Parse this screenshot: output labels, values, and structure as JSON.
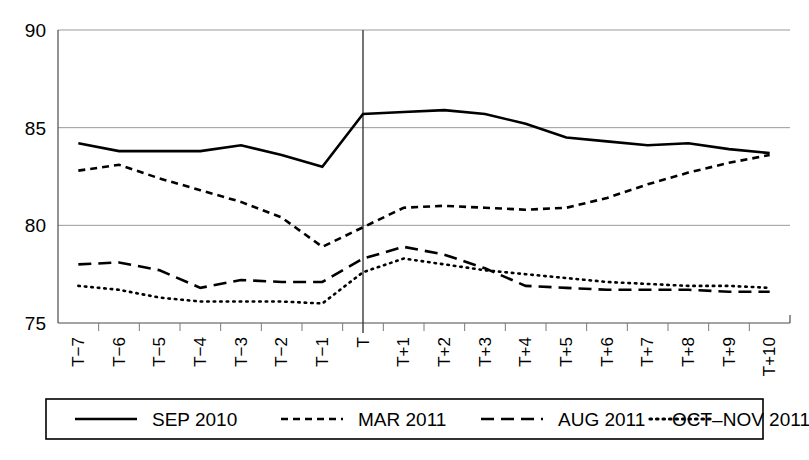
{
  "chart_data": {
    "type": "line",
    "title": "",
    "subtitle": "",
    "xlabel": "",
    "ylabel": "",
    "ylim": [
      75,
      90
    ],
    "yticks": [
      75,
      80,
      85,
      90
    ],
    "ytick_labels": [
      "75",
      "80",
      "85",
      "90"
    ],
    "grid": true,
    "legend_position": "bottom",
    "annotations": [
      {
        "type": "vertical-reference-line",
        "at_category": "T"
      }
    ],
    "categories": [
      "T−7",
      "T−6",
      "T−5",
      "T−4",
      "T−3",
      "T−2",
      "T−1",
      "T",
      "T+1",
      "T+2",
      "T+3",
      "T+4",
      "T+5",
      "T+6",
      "T+7",
      "T+8",
      "T+9",
      "T+10"
    ],
    "series": [
      {
        "name": "SEP 2010",
        "style": "solid",
        "color": "#000000",
        "values": [
          84.2,
          83.8,
          83.8,
          83.8,
          84.1,
          83.6,
          83.0,
          85.7,
          85.8,
          85.9,
          85.7,
          85.2,
          84.5,
          84.3,
          84.1,
          84.2,
          83.9,
          83.7
        ]
      },
      {
        "name": "MAR 2011",
        "style": "short-dash",
        "color": "#000000",
        "values": [
          82.8,
          83.1,
          82.4,
          81.8,
          81.2,
          80.4,
          78.9,
          79.9,
          80.9,
          81.0,
          80.9,
          80.8,
          80.9,
          81.4,
          82.1,
          82.7,
          83.2,
          83.6
        ]
      },
      {
        "name": "AUG 2011",
        "style": "long-dash",
        "color": "#000000",
        "values": [
          78.0,
          78.1,
          77.7,
          76.8,
          77.2,
          77.1,
          77.1,
          78.3,
          78.9,
          78.5,
          77.8,
          76.9,
          76.8,
          76.7,
          76.7,
          76.7,
          76.6,
          76.6
        ]
      },
      {
        "name": "OCT–NOV 2011",
        "style": "dotted",
        "color": "#000000",
        "values": [
          76.9,
          76.7,
          76.3,
          76.1,
          76.1,
          76.1,
          76.0,
          77.6,
          78.3,
          78.0,
          77.7,
          77.5,
          77.3,
          77.1,
          77.0,
          76.9,
          76.9,
          76.8
        ]
      }
    ]
  },
  "legend": {
    "entries": [
      {
        "label": "SEP 2010",
        "style": "solid"
      },
      {
        "label": "MAR 2011",
        "style": "short-dash"
      },
      {
        "label": "AUG 2011",
        "style": "long-dash"
      },
      {
        "label": "OCT–NOV 2011",
        "style": "dotted"
      }
    ]
  }
}
